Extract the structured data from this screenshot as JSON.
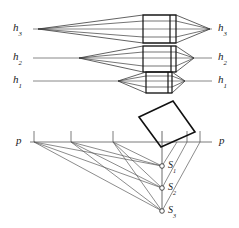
{
  "figure": {
    "title_hidden": "",
    "background_color": "#ffffff",
    "stroke_color": "#1a1a1a",
    "thin_stroke_color": "#4a4a4a",
    "width": 239,
    "height": 228
  },
  "upper_section": {
    "description": "Three horizontal optical axes with converging ray cones and lens/barrel bodies",
    "axes": [
      {
        "left_label": "h",
        "left_sub": "3",
        "right_label": "h",
        "right_sub": "3",
        "y": 29,
        "vertex_x": 38,
        "body_left_x": 143,
        "body_right_x": 176,
        "tip_x": 210
      },
      {
        "left_label": "h",
        "left_sub": "2",
        "right_label": "h",
        "right_sub": "2",
        "y": 58,
        "vertex_x": 79,
        "body_left_x": 143,
        "body_right_x": 176,
        "tip_x": 194
      },
      {
        "left_label": "h",
        "left_sub": "1",
        "right_label": "h",
        "right_sub": "1",
        "y": 81,
        "vertex_x": 118,
        "body_left_x": 146,
        "body_right_x": 172,
        "tip_x": 185
      }
    ]
  },
  "lower_section": {
    "description": "Perspective construction: picture line p with tick marks, tilted rectangle object, and station points S1 S2 S3",
    "picture_line": {
      "left_label": "p",
      "right_label": "p",
      "y": 142,
      "x_start": 30,
      "x_end": 212
    },
    "ticks": [
      {
        "x": 34,
        "top": 131,
        "bottom": 142
      },
      {
        "x": 71,
        "top": 131,
        "bottom": 142
      },
      {
        "x": 113,
        "top": 131,
        "bottom": 142
      },
      {
        "x": 162,
        "top": 131,
        "bottom": 152
      },
      {
        "x": 187,
        "top": 131,
        "bottom": 142
      },
      {
        "x": 200,
        "top": 131,
        "bottom": 142
      }
    ],
    "rectangle": {
      "points": "139,117 173,101 195,132 161,147",
      "rotated": true
    },
    "station_points": [
      {
        "label": "S",
        "sub": "1",
        "x": 162,
        "y": 166
      },
      {
        "label": "S",
        "sub": "2",
        "x": 162,
        "y": 188
      },
      {
        "label": "S",
        "sub": "3",
        "x": 162,
        "y": 211
      }
    ]
  }
}
